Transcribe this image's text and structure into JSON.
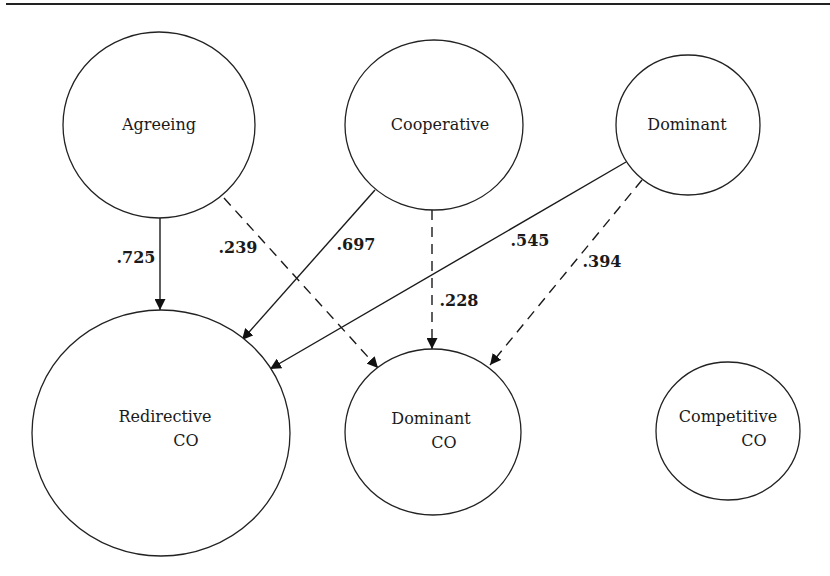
{
  "diagram": {
    "type": "path-diagram",
    "nodes": [
      {
        "id": "agreeing",
        "lines": [
          "Agreeing"
        ]
      },
      {
        "id": "cooperative",
        "lines": [
          "Cooperative"
        ]
      },
      {
        "id": "dominant",
        "lines": [
          "Dominant"
        ]
      },
      {
        "id": "redirective_co",
        "lines": [
          "Redirective",
          "CO"
        ]
      },
      {
        "id": "dominant_co",
        "lines": [
          "Dominant",
          "CO"
        ]
      },
      {
        "id": "competitive_co",
        "lines": [
          "Competitive",
          "CO"
        ]
      }
    ],
    "edges": [
      {
        "from": "agreeing",
        "to": "redirective_co",
        "style": "solid",
        "label": ".725"
      },
      {
        "from": "agreeing",
        "to": "dominant_co",
        "style": "dashed",
        "label": ".239"
      },
      {
        "from": "cooperative",
        "to": "redirective_co",
        "style": "solid",
        "label": ".697"
      },
      {
        "from": "cooperative",
        "to": "dominant_co",
        "style": "dashed",
        "label": ".228"
      },
      {
        "from": "dominant",
        "to": "redirective_co",
        "style": "solid",
        "label": ".545"
      },
      {
        "from": "dominant",
        "to": "dominant_co",
        "style": "dashed",
        "label": ".394"
      }
    ]
  }
}
